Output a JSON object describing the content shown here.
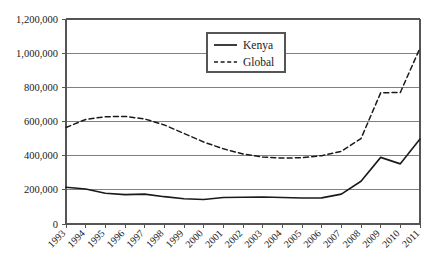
{
  "chart_data": {
    "type": "line",
    "title": "",
    "subtitle": "",
    "xlabel": "",
    "ylabel": "",
    "grid": true,
    "legend_position": "top-center",
    "categories": [
      "1993",
      "1994",
      "1995",
      "1996",
      "1997",
      "1998",
      "1999",
      "2000",
      "2001",
      "2002",
      "2003",
      "2004",
      "2005",
      "2006",
      "2007",
      "2008",
      "2009",
      "2010",
      "2011"
    ],
    "x": [
      1993,
      1994,
      1995,
      1996,
      1997,
      1998,
      1999,
      2000,
      2001,
      2002,
      2003,
      2004,
      2005,
      2006,
      2007,
      2008,
      2009,
      2010,
      2011
    ],
    "ylim": [
      0,
      1200000
    ],
    "xlim": [
      1993,
      2011
    ],
    "y_ticks": [
      0,
      200000,
      400000,
      600000,
      800000,
      1000000,
      1200000
    ],
    "y_tick_labels": [
      "0",
      "200,000",
      "400,000",
      "600,000",
      "800,000",
      "1,000,000",
      "1,200,000"
    ],
    "series": [
      {
        "name": "Kenya",
        "style": "solid",
        "color": "#1a1a1a",
        "values": [
          215000,
          205000,
          180000,
          172000,
          175000,
          160000,
          148000,
          143000,
          155000,
          157000,
          158000,
          155000,
          152000,
          153000,
          175000,
          250000,
          390000,
          352000,
          497000
        ]
      },
      {
        "name": "Global",
        "style": "dashed",
        "color": "#1a1a1a",
        "values": [
          565000,
          612000,
          628000,
          630000,
          615000,
          580000,
          530000,
          480000,
          440000,
          410000,
          392000,
          386000,
          388000,
          400000,
          425000,
          500000,
          768000,
          770000,
          1030000
        ]
      }
    ]
  },
  "legend": {
    "items": [
      {
        "label": "Kenya",
        "style": "solid"
      },
      {
        "label": "Global",
        "style": "dashed"
      }
    ]
  }
}
